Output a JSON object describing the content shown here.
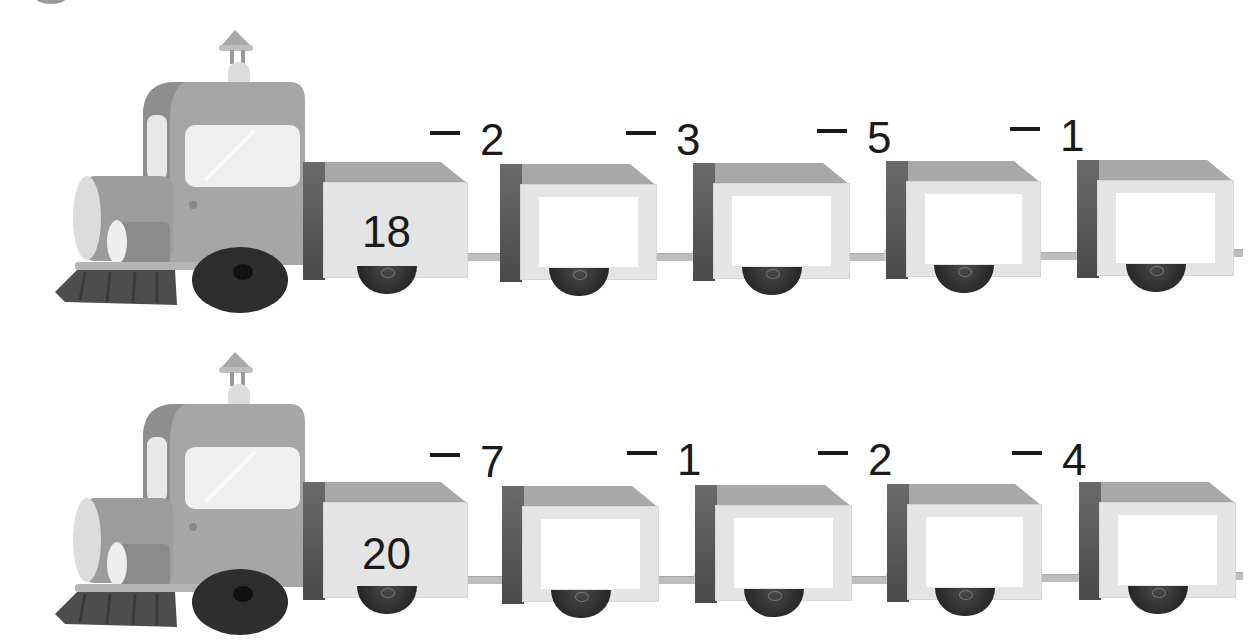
{
  "worksheet": {
    "rows": [
      {
        "start_value": "18",
        "operations": [
          {
            "operator": "−",
            "operand": "2"
          },
          {
            "operator": "−",
            "operand": "3"
          },
          {
            "operator": "−",
            "operand": "5"
          },
          {
            "operator": "−",
            "operand": "1"
          }
        ],
        "answers": [
          "",
          "",
          "",
          ""
        ]
      },
      {
        "start_value": "20",
        "operations": [
          {
            "operator": "−",
            "operand": "7"
          },
          {
            "operator": "−",
            "operand": "1"
          },
          {
            "operator": "−",
            "operand": "2"
          },
          {
            "operator": "−",
            "operand": "4"
          }
        ],
        "answers": [
          "",
          "",
          "",
          ""
        ]
      }
    ],
    "icons": {
      "engine": "sweeper-train-engine-icon",
      "wagon": "train-wagon-icon"
    },
    "colors": {
      "text": "#1a1a1a",
      "wagon_face": "#e4e4e4",
      "wagon_side": "#555555",
      "wagon_top": "#a8a8a8",
      "answer_box": "#ffffff",
      "engine_body": "#a6a6a6",
      "brush": "#4d4d4d"
    }
  }
}
